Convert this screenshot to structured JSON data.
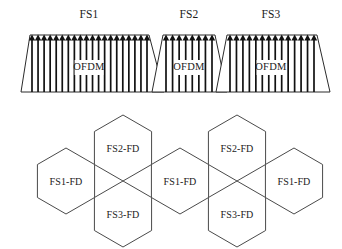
{
  "figure": {
    "background_color": "#ffffff",
    "line_color": "#2b2b2b",
    "hex_line_color": "#4a4a4a",
    "carrier_color": "#111111",
    "text_color": "#1a1a1a"
  },
  "spectrum": {
    "baseline_y": 92,
    "top_y": 35,
    "bands": [
      {
        "id": "fs1",
        "label": "FS1",
        "inner_label": "OFDM",
        "label_x": 89,
        "label_y": 18,
        "inner_label_x": 89,
        "inner_label_y": 70,
        "top_left_x": 30,
        "top_right_x": 149,
        "bottom_left_x": 21,
        "bottom_right_x": 164,
        "subcarriers": 20,
        "carrier_span_left": 32,
        "carrier_span_right": 147
      },
      {
        "id": "fs2",
        "label": "FS2",
        "inner_label": "OFDM",
        "label_x": 189,
        "label_y": 18,
        "inner_label_x": 189,
        "inner_label_y": 70,
        "top_left_x": 163,
        "top_right_x": 215,
        "bottom_left_x": 152,
        "bottom_right_x": 227,
        "subcarriers": 8,
        "carrier_span_left": 166,
        "carrier_span_right": 212
      },
      {
        "id": "fs3",
        "label": "FS3",
        "inner_label": "OFDM",
        "label_x": 271,
        "label_y": 18,
        "inner_label_x": 271,
        "inner_label_y": 70,
        "top_left_x": 227,
        "top_right_x": 317,
        "bottom_left_x": 216,
        "bottom_right_x": 330,
        "subcarriers": 14,
        "carrier_span_left": 230,
        "carrier_span_right": 314
      }
    ]
  },
  "cell_grid": {
    "hex_radius": 33,
    "cells": [
      {
        "id": "cell-left-fs1",
        "label": "FS1-FD",
        "cx": 66,
        "cy": 181
      },
      {
        "id": "cell-upper-fs2-a",
        "label": "FS2-FD",
        "cx": 123,
        "cy": 148
      },
      {
        "id": "cell-lower-fs3-a",
        "label": "FS3-FD",
        "cx": 123,
        "cy": 214
      },
      {
        "id": "cell-center-fs1",
        "label": "FS1-FD",
        "cx": 180,
        "cy": 181
      },
      {
        "id": "cell-upper-fs2-b",
        "label": "FS2-FD",
        "cx": 237,
        "cy": 148
      },
      {
        "id": "cell-lower-fs3-b",
        "label": "FS3-FD",
        "cx": 237,
        "cy": 214
      },
      {
        "id": "cell-right-fs1",
        "label": "FS1-FD",
        "cx": 294,
        "cy": 181
      }
    ]
  }
}
